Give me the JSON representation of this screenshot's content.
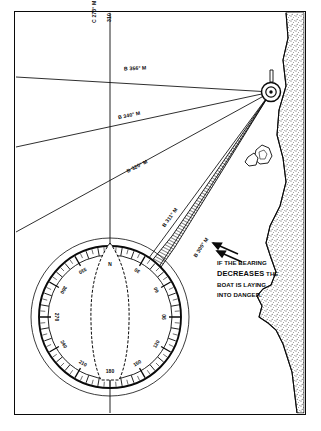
{
  "figure": {
    "border_color": "#0a0a0a",
    "background": "#ffffff",
    "land_fill": "#f2f2f2",
    "hatch_color": "#111111"
  },
  "course_line": {
    "label": "C 273° M",
    "second_label": "310",
    "orientation": "vertical"
  },
  "bearings": [
    {
      "id": "b356",
      "label": "B 356° M",
      "degrees": 356
    },
    {
      "id": "b340",
      "label": "B 340° M",
      "degrees": 340
    },
    {
      "id": "b320",
      "label": "B 320° M",
      "degrees": 320
    },
    {
      "id": "b311",
      "label": "B 311° M",
      "degrees": 311
    },
    {
      "id": "b300",
      "label": "B 300° M",
      "degrees": 300
    }
  ],
  "annotation": {
    "line1": "IF THE BEARING",
    "line2": "DECREASES",
    "line2b": "THE",
    "line3": "BOAT IS LAYING",
    "line4": "INTO DANGER."
  },
  "compass_rose": {
    "name": "compass-rose",
    "tick_interval_degrees": 5,
    "label_interval_degrees": 30,
    "labels": [
      {
        "text": "270",
        "rose_deg": 0
      },
      {
        "text": "300",
        "rose_deg": 30
      },
      {
        "text": "330",
        "rose_deg": 60
      },
      {
        "text": "N",
        "rose_deg": 90
      },
      {
        "text": "30",
        "rose_deg": 120
      },
      {
        "text": "60",
        "rose_deg": 150
      },
      {
        "text": "90",
        "rose_deg": 180
      },
      {
        "text": "120",
        "rose_deg": 210
      },
      {
        "text": "150",
        "rose_deg": 240
      },
      {
        "text": "180",
        "rose_deg": 270
      },
      {
        "text": "210",
        "rose_deg": 300
      },
      {
        "text": "240",
        "rose_deg": 330
      }
    ]
  },
  "boat": {
    "name": "boat-hull-outline"
  },
  "land": {
    "name": "coastline-landmass"
  },
  "navigation_mark": {
    "name": "headland-navigation-mark"
  },
  "danger_area": {
    "name": "hatched-danger-sector"
  }
}
